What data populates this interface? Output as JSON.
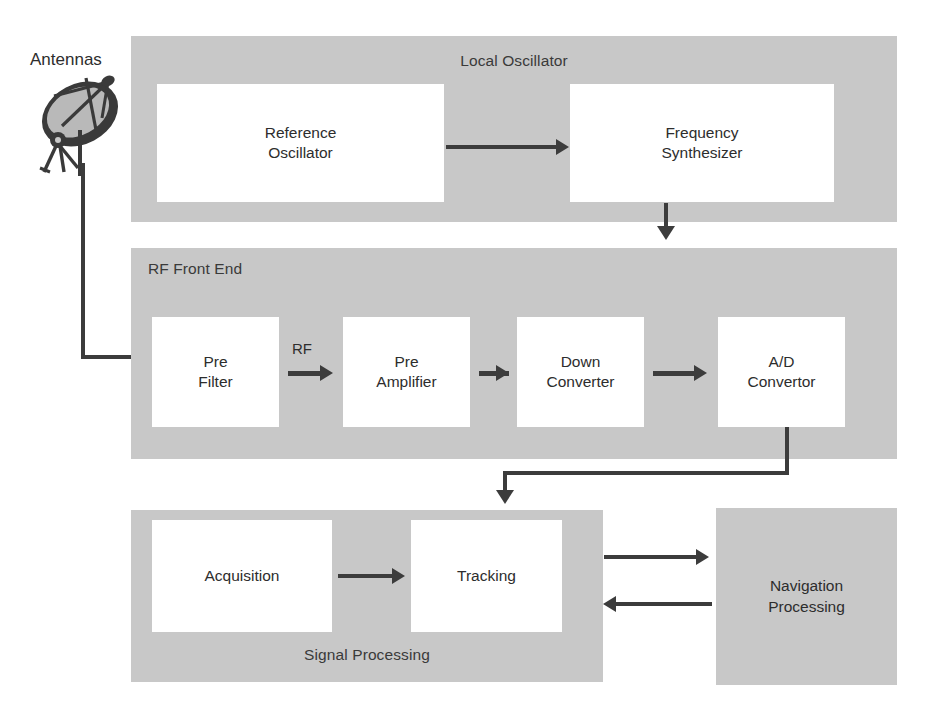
{
  "diagram": {
    "colors": {
      "panel_gray": "#c8c8c8",
      "block_white": "#ffffff",
      "arrow_dark": "#3c3c3c",
      "text": "#2d2d2d",
      "background": "#ffffff"
    }
  },
  "antenna": {
    "label": "Antennas",
    "icon": "satellite-dish-icon"
  },
  "panels": [
    {
      "id": "local-oscillator",
      "title": "Local Oscillator",
      "title_align": "center",
      "blocks": [
        {
          "id": "reference-oscillator",
          "line1": "Reference",
          "line2": "Oscillator",
          "fill": "white"
        },
        {
          "id": "frequency-synthesizer",
          "line1": "Frequency",
          "line2": "Synthesizer",
          "fill": "white"
        }
      ]
    },
    {
      "id": "rf-front-end",
      "title": "RF Front End",
      "title_align": "left",
      "blocks": [
        {
          "id": "pre-filter",
          "line1": "Pre",
          "line2": "Filter",
          "fill": "white"
        },
        {
          "id": "pre-amplifier",
          "line1": "Pre",
          "line2": "Amplifier",
          "fill": "white"
        },
        {
          "id": "down-converter",
          "line1": "Down",
          "line2": "Converter",
          "fill": "white"
        },
        {
          "id": "ad-convertor",
          "line1": "A/D",
          "line2": "Convertor",
          "fill": "white"
        }
      ]
    },
    {
      "id": "signal-processing",
      "title": "Signal Processing",
      "title_align": "center-bottom",
      "blocks": [
        {
          "id": "acquisition",
          "line1": "Acquisition",
          "line2": "",
          "fill": "white"
        },
        {
          "id": "tracking",
          "line1": "Tracking",
          "line2": "",
          "fill": "white"
        }
      ]
    }
  ],
  "standalone_blocks": [
    {
      "id": "navigation-processing",
      "line1": "Navigation",
      "line2": "Processing",
      "fill": "gray"
    }
  ],
  "edge_labels": [
    {
      "id": "rf-signal-label",
      "text": "RF"
    }
  ],
  "connections": [
    {
      "from": "antenna",
      "to": "pre-filter",
      "style": "elbow-down-right"
    },
    {
      "from": "reference-oscillator",
      "to": "frequency-synthesizer",
      "style": "straight-right"
    },
    {
      "from": "frequency-synthesizer",
      "to": "rf-front-end",
      "style": "straight-down"
    },
    {
      "from": "pre-filter",
      "to": "pre-amplifier",
      "style": "straight-right",
      "label": "RF"
    },
    {
      "from": "pre-amplifier",
      "to": "down-converter",
      "style": "straight-right"
    },
    {
      "from": "down-converter",
      "to": "ad-convertor",
      "style": "straight-right"
    },
    {
      "from": "ad-convertor",
      "to": "signal-processing",
      "style": "elbow-down-left-down"
    },
    {
      "from": "acquisition",
      "to": "tracking",
      "style": "straight-right"
    },
    {
      "from": "tracking",
      "to": "navigation-processing",
      "style": "straight-right"
    },
    {
      "from": "navigation-processing",
      "to": "tracking",
      "style": "straight-left"
    }
  ]
}
